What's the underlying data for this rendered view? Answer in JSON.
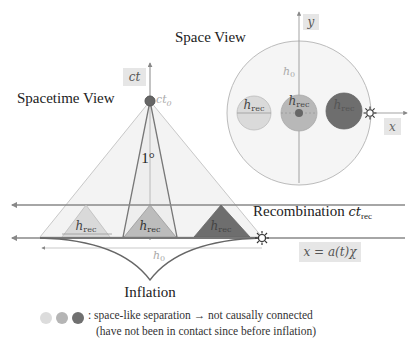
{
  "titles": {
    "spacetime_view": "Spacetime View",
    "space_view": "Space View",
    "inflation": "Inflation"
  },
  "axes": {
    "ct": "ct",
    "ct0": "ct",
    "ct0_sub": "0",
    "y": "y",
    "x": "x",
    "comoving": "x = a(t)χ"
  },
  "labels": {
    "angle": "1°",
    "h0_spacetime": "h",
    "h0_spacetime_sub": "0",
    "h0_space": "h",
    "h0_space_sub": "0",
    "recombination": "Recombination ",
    "recombination_math": "ct",
    "recombination_sub": "rec",
    "h_rec": "h",
    "h_rec_sub": "rec"
  },
  "legend": {
    "separator": ":",
    "line1": "space-like separation → not causally connected",
    "line2": "(have not been in contact since before inflation)"
  },
  "colors": {
    "light": "#d9d9d9",
    "medium": "#b3b3b3",
    "dark": "#6e6e6e",
    "line": "#7a7a7a",
    "cone_fill": "#f2f2f2",
    "circle_fill": "#f4f4f4"
  }
}
